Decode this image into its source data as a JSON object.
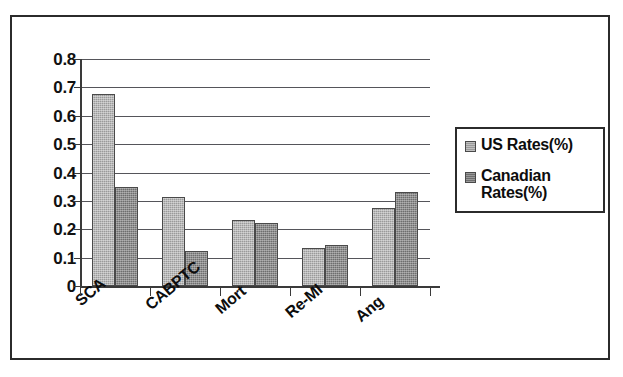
{
  "chart_data": {
    "type": "bar",
    "title": "",
    "subtitle": "",
    "xlabel": "",
    "ylabel": "",
    "ylim": [
      0,
      0.8
    ],
    "ytick_labels": [
      "0.8",
      "0.7",
      "0.6",
      "0.5",
      "0.4",
      "0.3",
      "0.2",
      "0.1",
      "0"
    ],
    "ytick_values": [
      0.8,
      0.7,
      0.6,
      0.5,
      0.4,
      0.3,
      0.2,
      0.1,
      0
    ],
    "grid": true,
    "legend_position": "right",
    "categories": [
      "SCA",
      "CABPTC",
      "Mort",
      "Re-MI",
      "Ang"
    ],
    "series": [
      {
        "name": "US Rates(%)",
        "color": "#9a9a9a",
        "values": [
          0.675,
          0.313,
          0.233,
          0.133,
          0.275
        ]
      },
      {
        "name": "Canadian Rates(%)",
        "color": "#6e6e6e",
        "values": [
          0.35,
          0.123,
          0.222,
          0.143,
          0.333
        ]
      }
    ]
  },
  "legend": {
    "entries": [
      {
        "label": "US Rates(%)",
        "swatch": "us-swatch-icon"
      },
      {
        "label": "Canadian Rates(%)",
        "swatch": "canadian-swatch-icon"
      }
    ]
  }
}
